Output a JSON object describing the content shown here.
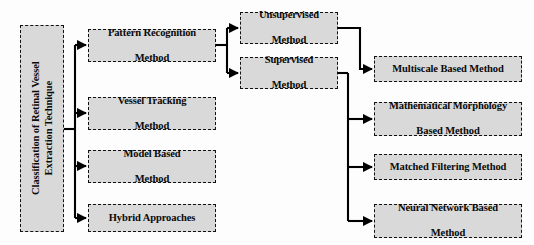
{
  "diagram": {
    "title": "Classification of Retinal Vessel Extraction Technique",
    "root": {
      "label_line1": "Classification of  Retinal Vessel",
      "label_line2": "Extraction Technique",
      "label": "Classification of  Retinal Vessel Extraction Technique"
    },
    "level1": [
      {
        "label_line1": "Pattern Recognition",
        "label_line2": "Method"
      },
      {
        "label_line1": "Vessel Tracking",
        "label_line2": "Method"
      },
      {
        "label_line1": "Model Based",
        "label_line2": "Method"
      },
      {
        "label_line1": "Hybrid Approaches",
        "label_line2": ""
      }
    ],
    "level2": [
      {
        "label_line1": "Unsupervised",
        "label_line2": "Method"
      },
      {
        "label_line1": "Supervised",
        "label_line2": "Method"
      }
    ],
    "level3": [
      {
        "label_line1": "Multiscale Based Method",
        "label_line2": ""
      },
      {
        "label_line1": "Mathematical Morphology",
        "label_line2": "Based Method"
      },
      {
        "label_line1": "Matched Filtering Method",
        "label_line2": ""
      },
      {
        "label_line1": "Neural Network Based",
        "label_line2": "Method"
      }
    ],
    "style": {
      "box_fill": "#d9d9d9",
      "box_border": "#111111",
      "connector": "#000000",
      "text": "#0a0a0a",
      "background": "#fdfdfd"
    }
  }
}
